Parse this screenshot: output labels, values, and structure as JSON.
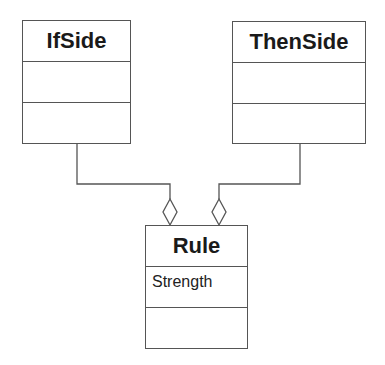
{
  "diagram": {
    "type": "UML class diagram",
    "classes": [
      {
        "name": "IfSide",
        "attributes": [],
        "operations": []
      },
      {
        "name": "ThenSide",
        "attributes": [],
        "operations": []
      },
      {
        "name": "Rule",
        "attributes": [
          "Strength"
        ],
        "operations": []
      }
    ],
    "relationships": [
      {
        "from": "IfSide",
        "to": "Rule",
        "type": "aggregation",
        "diamond_at": "Rule"
      },
      {
        "from": "ThenSide",
        "to": "Rule",
        "type": "aggregation",
        "diamond_at": "Rule"
      }
    ]
  }
}
